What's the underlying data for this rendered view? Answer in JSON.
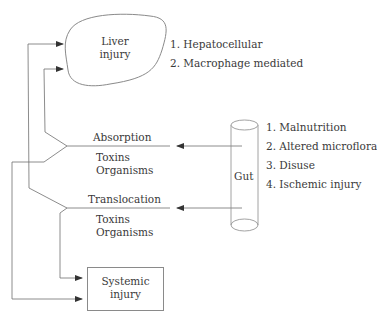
{
  "diagram": {
    "nodes": {
      "liver": {
        "label_line1": "Liver",
        "label_line2": "injury"
      },
      "gut": {
        "label": "Gut"
      },
      "systemic": {
        "label_line1": "Systemic",
        "label_line2": "injury"
      }
    },
    "liver_mechanisms": [
      "1. Hepatocellular",
      "2. Macrophage mediated"
    ],
    "gut_causes": [
      "1. Malnutrition",
      "2. Altered microflora",
      "3. Disuse",
      "4. Ischemic injury"
    ],
    "pathways": {
      "absorption": {
        "title": "Absorption",
        "line1": "Toxins",
        "line2": "Organisms"
      },
      "translocation": {
        "title": "Translocation",
        "line1": "Toxins",
        "line2": "Organisms"
      }
    },
    "colors": {
      "line": "#6e6e6e",
      "text": "#3a3a3a"
    }
  }
}
